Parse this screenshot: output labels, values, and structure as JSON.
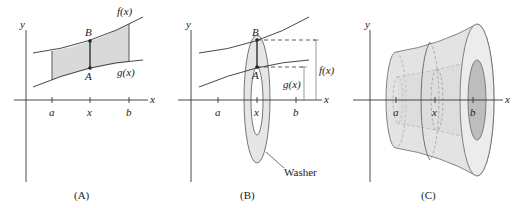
{
  "colors": {
    "ink": "#333333",
    "shade": "#d9d9d9",
    "washer_fill": "#e6e6e6",
    "solid_fill": "#e3e3e3",
    "solid_inner": "#cfcfcf",
    "background": "#ffffff"
  },
  "panels": [
    {
      "id": "A",
      "caption": "(A)",
      "axis_x_label": "x",
      "axis_y_label": "y",
      "ticks": [
        "a",
        "x",
        "b"
      ],
      "curve_upper_label": "f(x)",
      "curve_lower_label": "g(x)",
      "point_upper_label": "B",
      "point_lower_label": "A"
    },
    {
      "id": "B",
      "caption": "(B)",
      "axis_x_label": "x",
      "axis_y_label": "y",
      "ticks": [
        "a",
        "x",
        "b"
      ],
      "point_upper_label": "B",
      "point_lower_label": "A",
      "outer_radius_label": "f(x)",
      "inner_radius_label": "g(x)",
      "washer_label": "Washer"
    },
    {
      "id": "C",
      "caption": "(C)",
      "axis_x_label": "x",
      "axis_y_label": "y",
      "ticks": [
        "a",
        "x",
        "b"
      ]
    }
  ]
}
